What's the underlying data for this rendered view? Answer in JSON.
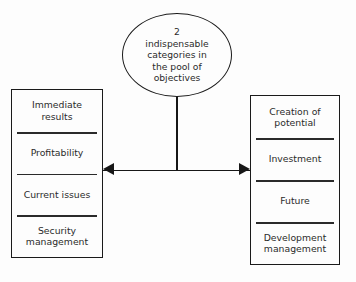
{
  "diagram": {
    "title": "2 indispensable categories in the pool of objectives",
    "center_node": {
      "shape": "ellipse",
      "text": "2\nindispensable\ncategories in\nthe pool of\nobjectives"
    },
    "connector": {
      "vertical_label": "stem-from-ellipse",
      "arrow_label": "double-headed-arrow",
      "direction": "bidirectional"
    },
    "left_group": {
      "name": "Immediate results group",
      "items": [
        {
          "label": "Immediate\nresults"
        },
        {
          "label": "Profitability"
        },
        {
          "label": "Current issues"
        },
        {
          "label": "Security\nmanagement"
        }
      ]
    },
    "right_group": {
      "name": "Creation of potential group",
      "items": [
        {
          "label": "Creation of\npotential"
        },
        {
          "label": "Investment"
        },
        {
          "label": "Future"
        },
        {
          "label": "Development\nmanagement"
        }
      ]
    },
    "colors": {
      "background": "#fdfdfd",
      "stroke": "#1a1a1a",
      "text": "#2b2b2b",
      "separator": "#2a2a2a"
    }
  }
}
